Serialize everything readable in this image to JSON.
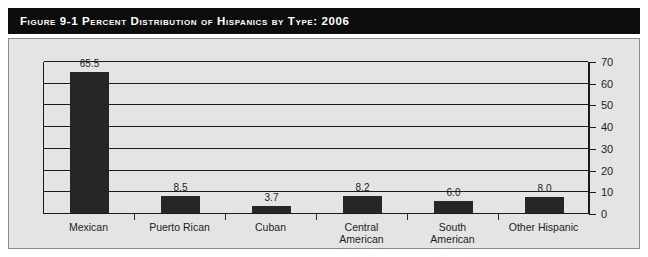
{
  "figure": {
    "label": "Figure 9-1",
    "title_full": "Figure 9-1   Percent Distribution of Hispanics by Type: 2006"
  },
  "chart_data": {
    "type": "bar",
    "title": "Percent Distribution of Hispanics by Type: 2006",
    "categories": [
      "Mexican",
      "Puerto Rican",
      "Cuban",
      "Central\nAmerican",
      "South\nAmerican",
      "Other Hispanic"
    ],
    "values": [
      65.5,
      8.5,
      3.7,
      8.2,
      6.0,
      8.0
    ],
    "value_labels": [
      "65.5",
      "8.5",
      "3.7",
      "8.2",
      "6.0",
      "8.0"
    ],
    "xlabel": "",
    "ylabel": "",
    "ylim": [
      0,
      70
    ],
    "yticks": [
      0,
      10,
      20,
      30,
      40,
      50,
      60,
      70
    ],
    "ytick_labels": [
      "0",
      "10",
      "20",
      "30",
      "40",
      "50",
      "60",
      "70"
    ],
    "y_axis_position": "right",
    "grid": true,
    "grid_axis": "y",
    "legend": false,
    "bar_color": "#262626",
    "plot_background": "#e4e4e4"
  },
  "colors": {
    "title_bar_background": "#0d0d0d",
    "title_text": "#ffffff",
    "panel_background": "#e4e4e4",
    "panel_border": "#8a8a8a",
    "axis": "#1a1a1a",
    "bar": "#262626",
    "text": "#1d1d1d"
  }
}
